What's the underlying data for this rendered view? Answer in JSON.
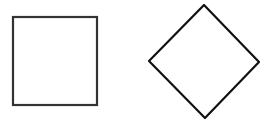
{
  "canvas": {
    "width": 270,
    "height": 130,
    "background": "#ffffff"
  },
  "shapes": [
    {
      "type": "square",
      "x": 13,
      "y": 17,
      "width": 84,
      "height": 88,
      "stroke": "#333333",
      "stroke_width": 2.2,
      "fill": "#ffffff"
    },
    {
      "type": "diamond",
      "points": [
        [
          204,
          5
        ],
        [
          259,
          62
        ],
        [
          205,
          118
        ],
        [
          149,
          61
        ]
      ],
      "stroke": "#111111",
      "stroke_width": 2.2,
      "fill": "#ffffff"
    }
  ]
}
